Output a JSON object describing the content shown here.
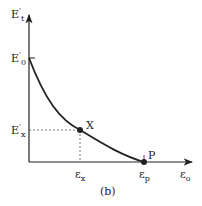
{
  "diagram": {
    "y_axis_label": "E",
    "y_axis_sup": "'",
    "y_axis_sub": "t",
    "y_intercept_label": "E",
    "y_intercept_sup": "'",
    "y_intercept_sub": "0",
    "x_point_y_label": "E",
    "x_point_y_sup": "'",
    "x_point_y_sub": "x",
    "x_axis_label": "ε",
    "x_axis_sub": "o",
    "x_point_x_label": "ε",
    "x_point_x_sub": "x",
    "p_x_label": "ε",
    "p_x_sub": "p",
    "point_x_label": "X",
    "point_p_label": "P",
    "caption": "(b)",
    "colors": {
      "line": "#222222",
      "dash": "#555555"
    }
  }
}
